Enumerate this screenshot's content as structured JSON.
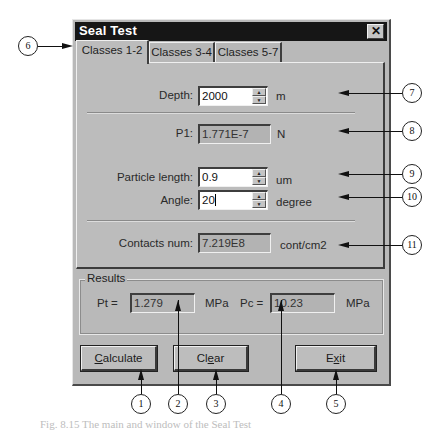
{
  "window": {
    "title": "Seal Test",
    "close_icon": "close-icon (X)"
  },
  "tabs": [
    {
      "label": "Classes 1-2",
      "active": true
    },
    {
      "label": "Classes 3-4",
      "active": false
    },
    {
      "label": "Classes 5-7",
      "active": false
    }
  ],
  "form": {
    "depth": {
      "label": "Depth:",
      "value": "2000",
      "unit": "m"
    },
    "p1": {
      "label": "P1:",
      "value": "1.771E-7",
      "unit": "N"
    },
    "particle_length": {
      "label": "Particle length:",
      "value": "0.9",
      "unit": "um"
    },
    "angle": {
      "label": "Angle:",
      "value": "20",
      "unit": "degree"
    },
    "contacts_num": {
      "label": "Contacts num:",
      "value": "7.219E8",
      "unit": "cont/cm2"
    }
  },
  "results": {
    "group_label": "Results",
    "pt": {
      "label": "Pt =",
      "value": "1.279",
      "unit": "MPa"
    },
    "pc": {
      "label": "Pc =",
      "value": "10.23",
      "unit": "MPa"
    }
  },
  "buttons": {
    "calculate": {
      "pre": "",
      "mnemonic": "C",
      "post": "alculate"
    },
    "clear": {
      "pre": "Cl",
      "mnemonic": "e",
      "post": "ar"
    },
    "exit": {
      "pre": "E",
      "mnemonic": "x",
      "post": "it"
    }
  },
  "callouts": [
    "1",
    "2",
    "3",
    "4",
    "5",
    "6",
    "7",
    "8",
    "9",
    "10",
    "11"
  ],
  "caption": "Fig. 8.15  The main and window of the Seal Test"
}
